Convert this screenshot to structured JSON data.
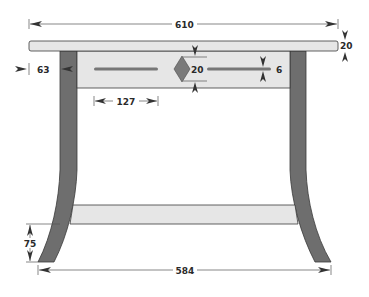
{
  "diagram": {
    "type": "technical-drawing",
    "units": "mm",
    "colors": {
      "wood_light": "#e6e6e6",
      "leg_dark": "#6e6e6e",
      "slot": "#777777",
      "diamond": "#7a7a7a",
      "outline": "#3a3a3a",
      "dimension_line": "#555555",
      "text": "#2a2a2a"
    },
    "parts": [
      {
        "name": "top",
        "label": "Table top"
      },
      {
        "name": "apron",
        "label": "Apron"
      },
      {
        "name": "left-leg",
        "label": "Left leg (curved)"
      },
      {
        "name": "right-leg",
        "label": "Right leg (curved)"
      },
      {
        "name": "stretcher",
        "label": "Lower stretcher"
      },
      {
        "name": "left-slot",
        "label": "Left slot"
      },
      {
        "name": "right-slot",
        "label": "Right slot"
      },
      {
        "name": "diamond-inlay",
        "label": "Diamond inlay"
      }
    ],
    "dimensions": {
      "top_width": "610",
      "top_thickness": "20",
      "apron_height": "63",
      "diamond_height": "20",
      "slot_width": "6",
      "slot_length": "127",
      "foot_height": "75",
      "foot_span": "584"
    }
  }
}
